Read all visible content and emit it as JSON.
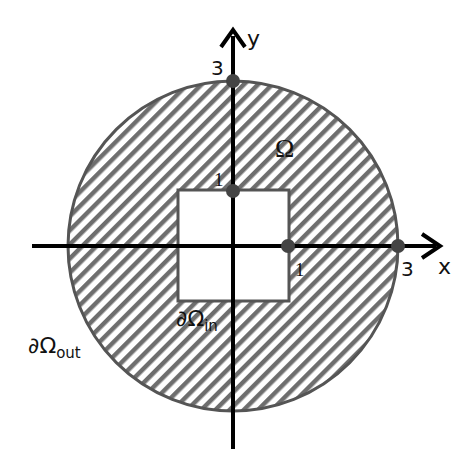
{
  "diagram": {
    "region_label": "Ω",
    "outer_boundary_label": {
      "main": "∂Ω",
      "sub": "out"
    },
    "inner_boundary_label": {
      "main": "∂Ω",
      "sub": "in"
    },
    "axes": {
      "x_label": "x",
      "y_label": "y"
    },
    "ticks": {
      "x_inner": "1",
      "x_outer": "3",
      "y_inner": "1",
      "y_outer": "3"
    },
    "colors": {
      "hatch": "#6e6e6e",
      "boundary": "#555555",
      "axis": "#000000",
      "point": "#444444"
    }
  }
}
